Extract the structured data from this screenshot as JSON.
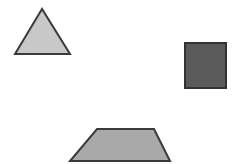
{
  "canvas": {
    "width": 232,
    "height": 164,
    "background": "#ffffff"
  },
  "shapes": [
    {
      "type": "triangle",
      "points": "42,9 15,54 70,54",
      "fill": "#c8c8c8",
      "stroke": "#3a3a3a"
    },
    {
      "type": "square",
      "x": 185,
      "y": 43,
      "width": 41,
      "height": 45,
      "fill": "#5a5a5a",
      "stroke": "#333333"
    },
    {
      "type": "trapezoid",
      "points": "97,129 154,129 170,161 70,161",
      "fill": "#a9a9a9",
      "stroke": "#3a3a3a"
    }
  ]
}
